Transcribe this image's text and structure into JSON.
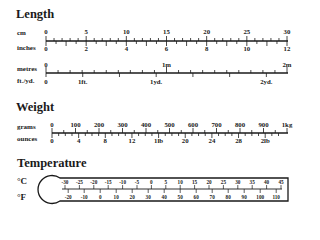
{
  "length": {
    "title": "Length",
    "cm": {
      "unit": "cm",
      "labels": [
        "0",
        "5",
        "10",
        "15",
        "20",
        "25",
        "30"
      ]
    },
    "inches": {
      "unit": "inches",
      "labels": [
        "0",
        "2",
        "4",
        "6",
        "8",
        "10",
        "12"
      ]
    },
    "metres": {
      "unit": "metres",
      "labels": [
        "0",
        "1m",
        "2m"
      ]
    },
    "ftyd": {
      "unit": "ft./yd.",
      "labels": [
        "0",
        "1ft.",
        "1yd.",
        "2yd."
      ]
    }
  },
  "weight": {
    "title": "Weight",
    "grams": {
      "unit": "grams",
      "labels": [
        "0",
        "100",
        "200",
        "300",
        "400",
        "500",
        "600",
        "700",
        "800",
        "900",
        "1kg"
      ]
    },
    "ounces": {
      "unit": "ounces",
      "labels": [
        "0",
        "4",
        "8",
        "12",
        "1lb",
        "20",
        "24",
        "28",
        "2lb"
      ]
    }
  },
  "temperature": {
    "title": "Temperature",
    "celsius": {
      "unit": "°C",
      "labels": [
        "-30",
        "-25",
        "-20",
        "-15",
        "-10",
        "-5",
        "0",
        "5",
        "10",
        "15",
        "20",
        "25",
        "30",
        "35",
        "40",
        "45"
      ]
    },
    "fahrenheit": {
      "unit": "°F",
      "labels": [
        "-20",
        "-10",
        "0",
        "10",
        "20",
        "30",
        "40",
        "50",
        "60",
        "70",
        "80",
        "90",
        "100",
        "110"
      ]
    }
  }
}
